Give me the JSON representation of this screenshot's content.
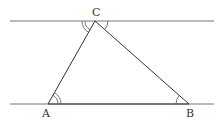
{
  "diagram": {
    "type": "geometry",
    "stroke_color": "#555555",
    "labels": {
      "A": "A",
      "B": "B",
      "C": "C"
    },
    "points": {
      "A": [
        48,
        104
      ],
      "B": [
        189,
        104
      ],
      "C": [
        95,
        21
      ]
    },
    "parallel_lines": [
      {
        "name": "upper-line",
        "y": 21,
        "x1": 10,
        "x2": 214
      },
      {
        "name": "lower-line",
        "y": 104,
        "x1": 10,
        "x2": 214
      }
    ],
    "angle_marks": [
      {
        "at": "A",
        "arcs": 2,
        "between": [
          "AB",
          "AC"
        ]
      },
      {
        "at": "B",
        "arcs": 1,
        "between": [
          "BA",
          "BC"
        ]
      },
      {
        "at": "C",
        "side": "left",
        "arcs": 2,
        "between": [
          "upper-line-left",
          "CA"
        ]
      },
      {
        "at": "C",
        "side": "right",
        "arcs": 1,
        "between": [
          "upper-line-right",
          "CB"
        ]
      }
    ]
  }
}
